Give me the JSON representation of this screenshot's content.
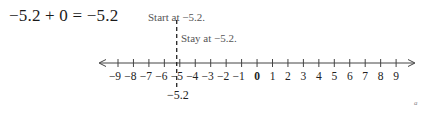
{
  "equation": {
    "text": "−5.2 + 0 = −5.2"
  },
  "annotations": {
    "start": "Start at −5.2.",
    "stay": "Stay at −5.2."
  },
  "point": {
    "label": "−5.2",
    "value": -5.2
  },
  "number_line": {
    "min": -9,
    "max": 9,
    "step": 1,
    "tick_labels": [
      "−9",
      "−8",
      "−7",
      "−6",
      "−5",
      "−4",
      "−3",
      "−2",
      "−1",
      "0",
      "1",
      "2",
      "3",
      "4",
      "5",
      "6",
      "7",
      "8",
      "9"
    ],
    "bold_label": "0",
    "arrows": "both"
  },
  "corner_mark": "a",
  "colors": {
    "axis": "#444444",
    "text": "#222222",
    "annotation": "#555555",
    "dash": "#222222"
  }
}
